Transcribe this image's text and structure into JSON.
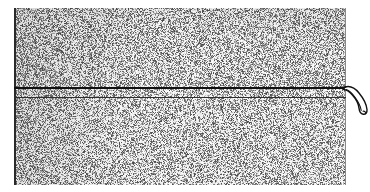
{
  "figure": {
    "kind": "scanned-halftone-plate",
    "caption": "",
    "canvas": {
      "width": 370,
      "height": 192,
      "background": "#ffffff"
    }
  },
  "plate": {
    "name": "speckled-halftone-region",
    "x": 14,
    "y": 8,
    "width": 332,
    "height": 177,
    "fill": "#ffffff",
    "speckle_color": "#6e6e6e",
    "speckle_density": 0.5,
    "speckle_cell_px": 1
  },
  "borders": {
    "left": {
      "x": 14,
      "y": 8,
      "width": 2,
      "height": 177,
      "color": "#2a2a2a"
    },
    "right": {
      "x": 345,
      "y": 8,
      "width": 1,
      "height": 177,
      "color": "#8a8a8a"
    }
  },
  "rules": [
    {
      "label": "upper-rule",
      "x": 14,
      "y": 87,
      "width": 332,
      "thickness": 2,
      "color": "#111111"
    },
    {
      "label": "lower-rule",
      "x": 14,
      "y": 97,
      "width": 332,
      "thickness": 1,
      "color": "#2e2e2e"
    }
  ],
  "hook": {
    "label": "curl-terminus",
    "x": 336,
    "y": 80,
    "width": 34,
    "height": 38,
    "stroke": "#111111",
    "stroke_width": 1.4,
    "fill": "#ffffff",
    "outer_path": "M 9 7 C 14 5.5, 19 8, 23 13 C 27.5 18.5, 30.5 24, 31 29.5 C 31.3 32.8, 29.6 34.6, 27.2 34.2 C 24.8 33.8, 23.4 31.6, 23.1 28.6 C 22.7 24.2, 20.2 19.2, 16.6 15.2 C 13.2 11.4, 10.4 9.6, 7.4 9.4 Z",
    "inner_path": "M 10.2 9.6 C 13.2 10.6, 16.2 13.4, 19.2 17.6 C 22.6 22.4, 24.8 27.2, 25.2 30.4",
    "tail_path": "M 3.5 7.6 L 9.6 7.0",
    "tip_path": "M 27.0 31.2 C 28.4 31.0, 29.4 31.8, 29.6 33.0"
  },
  "chart_data": {
    "type": "image",
    "title": "",
    "elements": [
      {
        "name": "speckle-field",
        "x": 14,
        "y": 8,
        "w": 332,
        "h": 177
      },
      {
        "name": "upper-rule",
        "x1": 14,
        "y1": 88,
        "x2": 346,
        "y2": 88
      },
      {
        "name": "lower-rule",
        "x1": 14,
        "y1": 97,
        "x2": 346,
        "y2": 97
      },
      {
        "name": "left-border",
        "x1": 15,
        "y1": 8,
        "x2": 15,
        "y2": 185
      },
      {
        "name": "right-border",
        "x1": 345,
        "y1": 8,
        "x2": 345,
        "y2": 185
      },
      {
        "name": "hook-curl",
        "x": 345,
        "y": 87,
        "w": 22,
        "h": 27
      }
    ]
  }
}
